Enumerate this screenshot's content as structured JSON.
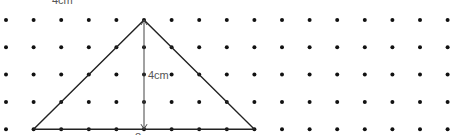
{
  "diagram": {
    "top_label": "4cm",
    "height_label": "4cm",
    "base_label": "8cm",
    "grid": {
      "cols": 17,
      "rows": 5,
      "x0": 6,
      "y0": 20,
      "dx": 27.6,
      "dy": 27.3
    },
    "triangle": {
      "vertices": [
        [
          1,
          4
        ],
        [
          5,
          0
        ],
        [
          9,
          4
        ]
      ]
    },
    "colors": {
      "dot": "#111111",
      "line": "#222222",
      "label": "#555555"
    }
  }
}
